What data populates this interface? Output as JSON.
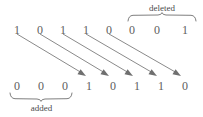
{
  "diagram": {
    "top_row": {
      "name": "original-bit-sequence",
      "bits": [
        "1",
        "0",
        "1",
        "1",
        "0",
        "0",
        "0",
        "1"
      ]
    },
    "bottom_row": {
      "name": "resulting-bit-sequence",
      "bits": [
        "0",
        "0",
        "0",
        "1",
        "0",
        "1",
        "1",
        "0"
      ]
    },
    "annotations": {
      "deleted_label": "deleted",
      "added_label": "added"
    },
    "colors": {
      "bit_text": "#5e5e5e",
      "label_text": "#4a4a4a",
      "arrow": "#8a8a8a",
      "brace": "#6f6f6f",
      "background": "#ffffff"
    },
    "mapping": {
      "description": "arrows-map-top-bits-1-to-5-onto-bottom-bits-4-to-8",
      "arrow_count": 5,
      "source_indices": [
        0,
        1,
        2,
        3,
        4
      ],
      "target_indices": [
        3,
        4,
        5,
        6,
        7
      ]
    },
    "deleted_span": {
      "row": "top",
      "indices": [
        5,
        6,
        7
      ],
      "bits": [
        "0",
        "0",
        "1"
      ]
    },
    "added_span": {
      "row": "bottom",
      "indices": [
        0,
        1,
        2
      ],
      "bits": [
        "0",
        "0",
        "0"
      ]
    }
  }
}
